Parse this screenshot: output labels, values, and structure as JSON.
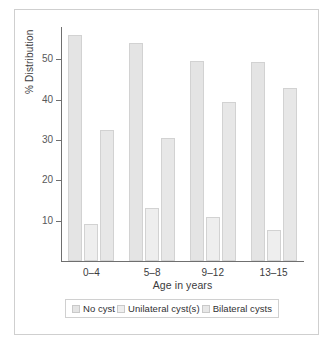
{
  "chart_data": {
    "type": "bar",
    "title": "",
    "xlabel": "Age in years",
    "ylabel": "% Distribution",
    "categories": [
      "0–4",
      "5–8",
      "9–12",
      "13–15"
    ],
    "series": [
      {
        "name": "No cyst",
        "values": [
          56.0,
          54.0,
          49.5,
          49.3
        ],
        "color": "#e4e4e4"
      },
      {
        "name": "Unilateral cyst(s)",
        "values": [
          9.2,
          13.2,
          10.8,
          7.8
        ],
        "color": "#eeeeee"
      },
      {
        "name": "Bilateral cysts",
        "values": [
          32.5,
          30.5,
          39.5,
          42.8
        ],
        "color": "#e7e7e7"
      }
    ],
    "ylim": [
      0,
      58
    ],
    "yticks": [
      10,
      20,
      30,
      40,
      50
    ],
    "ytick_labels": [
      "10",
      "20",
      "30",
      "40",
      "50"
    ],
    "grid": false,
    "legend_position": "bottom"
  },
  "legend": {
    "items": [
      {
        "label": "No cyst"
      },
      {
        "label": "Unilateral cyst(s)"
      },
      {
        "label": "Bilateral cysts"
      }
    ]
  },
  "axes": {
    "y_title": "% Distribution",
    "x_title": "Age in years"
  }
}
